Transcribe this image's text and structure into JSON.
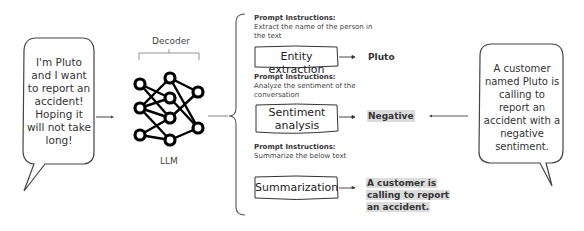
{
  "input_bubble": {
    "lines": [
      "I'm Pluto",
      "and I want",
      "to report an",
      "accident!",
      "Hoping it",
      "will not take",
      "long!"
    ]
  },
  "model": {
    "decoder_label": "Decoder",
    "llm_label": "LLM"
  },
  "tasks": [
    {
      "prompt_heading": "Prompt Instructions:",
      "prompt_lines": [
        "Extract the name of the person in",
        "the text"
      ],
      "task_lines": [
        "Entity extraction"
      ],
      "output_lines": [
        "Pluto"
      ],
      "output_highlighted": false
    },
    {
      "prompt_heading": "Prompt Instructions:",
      "prompt_lines": [
        "Analyze the sentiment of the",
        "conversation"
      ],
      "task_lines": [
        "Sentiment",
        "analysis"
      ],
      "output_lines": [
        "Negative"
      ],
      "output_highlighted": true
    },
    {
      "prompt_heading": "Prompt Instructions:",
      "prompt_lines": [
        "Summarize the below text"
      ],
      "task_lines": [
        "Summarization"
      ],
      "output_lines": [
        "A customer is",
        "calling to report",
        "an accident."
      ],
      "output_highlighted": true
    }
  ],
  "output_bubble": {
    "lines": [
      "A customer",
      "named Pluto is",
      "calling to",
      "report an",
      "accident with a",
      "negative",
      "sentiment."
    ]
  },
  "colors": {
    "stroke": "#333333",
    "highlight": "#dcdcdc",
    "bracket": "#888888"
  }
}
